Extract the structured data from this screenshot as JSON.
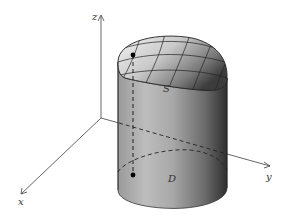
{
  "figure": {
    "axes": {
      "x_label": "x",
      "y_label": "y",
      "z_label": "z"
    },
    "labels": {
      "surface": "S",
      "region": "D"
    },
    "colors": {
      "axis": "#555555",
      "cylinder_light": "#cfcfcf",
      "cylinder_dark": "#3a3a3a",
      "surface_light": "#e6e6e6",
      "surface_dark": "#555555",
      "grid": "#222222",
      "dashed": "#222222"
    }
  }
}
